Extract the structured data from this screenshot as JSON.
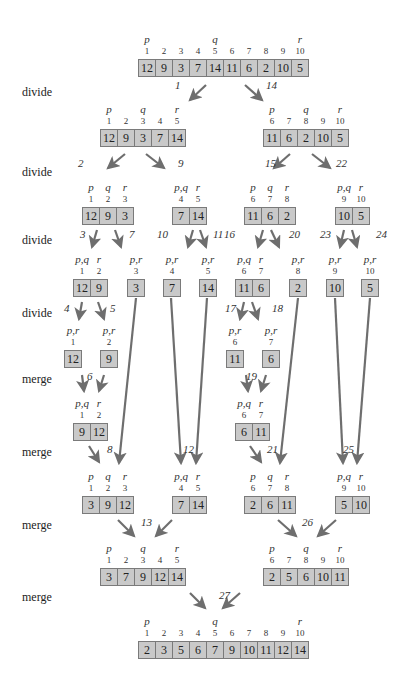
{
  "diagram": {
    "colors": {
      "cell_fill": "#c9c9c9",
      "cell_border": "#7a7a7a",
      "arrow": "#6e6e6e",
      "text": "#222222"
    },
    "row_labels": [
      {
        "text": "divide",
        "y": 93
      },
      {
        "text": "divide",
        "y": 173
      },
      {
        "text": "divide",
        "y": 241
      },
      {
        "text": "divide",
        "y": 314
      },
      {
        "text": "merge",
        "y": 380
      },
      {
        "text": "merge",
        "y": 453
      },
      {
        "text": "merge",
        "y": 526
      },
      {
        "text": "merge",
        "y": 598
      }
    ],
    "arrays": [
      {
        "id": "a0",
        "x": 138,
        "y": 59,
        "start": 1,
        "values": [
          12,
          9,
          3,
          7,
          14,
          11,
          6,
          2,
          10,
          5
        ],
        "pointers": {
          "p": 0,
          "q": 4,
          "r": 9
        }
      },
      {
        "id": "a1",
        "x": 100,
        "y": 129,
        "start": 1,
        "values": [
          12,
          9,
          3,
          7,
          14
        ],
        "pointers": {
          "p": 0,
          "q": 2,
          "r": 4
        }
      },
      {
        "id": "a2",
        "x": 263,
        "y": 129,
        "start": 6,
        "values": [
          11,
          6,
          2,
          10,
          5
        ],
        "pointers": {
          "p": 0,
          "q": 2,
          "r": 4
        }
      },
      {
        "id": "a3",
        "x": 82,
        "y": 207,
        "start": 1,
        "values": [
          12,
          9,
          3
        ],
        "pointers": {
          "p": 0,
          "q": 1,
          "r": 2
        }
      },
      {
        "id": "a4",
        "x": 172,
        "y": 207,
        "start": 4,
        "values": [
          7,
          14
        ],
        "pointers": {
          "p,q": 0,
          "r": 1
        }
      },
      {
        "id": "a5",
        "x": 244,
        "y": 207,
        "start": 6,
        "values": [
          11,
          6,
          2
        ],
        "pointers": {
          "p": 0,
          "q": 1,
          "r": 2
        }
      },
      {
        "id": "a6",
        "x": 335,
        "y": 207,
        "start": 9,
        "values": [
          10,
          5
        ],
        "pointers": {
          "p,q": 0,
          "r": 1
        }
      },
      {
        "id": "a7",
        "x": 73,
        "y": 279,
        "start": 1,
        "values": [
          12,
          9
        ],
        "pointers": {
          "p,q": 0,
          "r": 1
        }
      },
      {
        "id": "a8",
        "x": 127,
        "y": 279,
        "start": 3,
        "values": [
          3
        ],
        "pointers": {
          "p,r": 0
        }
      },
      {
        "id": "a9",
        "x": 163,
        "y": 279,
        "start": 4,
        "values": [
          7
        ],
        "pointers": {
          "p,r": 0
        }
      },
      {
        "id": "a10",
        "x": 199,
        "y": 279,
        "start": 5,
        "values": [
          14
        ],
        "pointers": {
          "p,r": 0
        }
      },
      {
        "id": "a11",
        "x": 235,
        "y": 279,
        "start": 6,
        "values": [
          11,
          6
        ],
        "pointers": {
          "p,q": 0,
          "r": 1
        }
      },
      {
        "id": "a12",
        "x": 289,
        "y": 279,
        "start": 8,
        "values": [
          2
        ],
        "pointers": {
          "p,r": 0
        }
      },
      {
        "id": "a13",
        "x": 326,
        "y": 279,
        "start": 9,
        "values": [
          10
        ],
        "pointers": {
          "p,r": 0
        }
      },
      {
        "id": "a14",
        "x": 361,
        "y": 279,
        "start": 10,
        "values": [
          5
        ],
        "pointers": {
          "p,r": 0
        }
      },
      {
        "id": "a15",
        "x": 64,
        "y": 350,
        "start": 1,
        "values": [
          12
        ],
        "pointers": {
          "p,r": 0
        }
      },
      {
        "id": "a16",
        "x": 100,
        "y": 350,
        "start": 2,
        "values": [
          9
        ],
        "pointers": {
          "p,r": 0
        }
      },
      {
        "id": "a17",
        "x": 226,
        "y": 350,
        "start": 6,
        "values": [
          11
        ],
        "pointers": {
          "p,r": 0
        }
      },
      {
        "id": "a18",
        "x": 262,
        "y": 350,
        "start": 7,
        "values": [
          6
        ],
        "pointers": {
          "p,r": 0
        }
      },
      {
        "id": "a19",
        "x": 73,
        "y": 423,
        "start": 1,
        "values": [
          9,
          12
        ],
        "pointers": {
          "p,q": 0,
          "r": 1
        }
      },
      {
        "id": "a20",
        "x": 235,
        "y": 423,
        "start": 6,
        "values": [
          6,
          11
        ],
        "pointers": {
          "p,q": 0,
          "r": 1
        }
      },
      {
        "id": "a21",
        "x": 82,
        "y": 496,
        "start": 1,
        "values": [
          3,
          9,
          12
        ],
        "pointers": {
          "p": 0,
          "q": 1,
          "r": 2
        }
      },
      {
        "id": "a22",
        "x": 172,
        "y": 496,
        "start": 4,
        "values": [
          7,
          14
        ],
        "pointers": {
          "p,q": 0,
          "r": 1
        }
      },
      {
        "id": "a23",
        "x": 244,
        "y": 496,
        "start": 6,
        "values": [
          2,
          6,
          11
        ],
        "pointers": {
          "p": 0,
          "q": 1,
          "r": 2
        }
      },
      {
        "id": "a24",
        "x": 335,
        "y": 496,
        "start": 9,
        "values": [
          5,
          10
        ],
        "pointers": {
          "p,q": 0,
          "r": 1
        }
      },
      {
        "id": "a25",
        "x": 100,
        "y": 568,
        "start": 1,
        "values": [
          3,
          7,
          9,
          12,
          14
        ],
        "pointers": {
          "p": 0,
          "q": 2,
          "r": 4
        }
      },
      {
        "id": "a26",
        "x": 263,
        "y": 568,
        "start": 6,
        "values": [
          2,
          5,
          6,
          10,
          11
        ],
        "pointers": {
          "p": 0,
          "q": 2,
          "r": 4
        }
      },
      {
        "id": "a27",
        "x": 138,
        "y": 641,
        "start": 1,
        "values": [
          2,
          3,
          5,
          6,
          7,
          9,
          10,
          11,
          12,
          14
        ],
        "pointers": {
          "p": 0,
          "q": 4,
          "r": 9
        }
      }
    ],
    "steps": [
      {
        "n": "1",
        "x": 175,
        "y": 87
      },
      {
        "n": "14",
        "x": 266,
        "y": 87
      },
      {
        "n": "2",
        "x": 78,
        "y": 165
      },
      {
        "n": "9",
        "x": 178,
        "y": 165
      },
      {
        "n": "15",
        "x": 265,
        "y": 165
      },
      {
        "n": "22",
        "x": 336,
        "y": 165
      },
      {
        "n": "3",
        "x": 80,
        "y": 236
      },
      {
        "n": "7",
        "x": 129,
        "y": 236
      },
      {
        "n": "10",
        "x": 157,
        "y": 236
      },
      {
        "n": "11",
        "x": 213,
        "y": 236
      },
      {
        "n": "16",
        "x": 224,
        "y": 236
      },
      {
        "n": "20",
        "x": 289,
        "y": 236
      },
      {
        "n": "23",
        "x": 320,
        "y": 236
      },
      {
        "n": "24",
        "x": 376,
        "y": 236
      },
      {
        "n": "4",
        "x": 64,
        "y": 310
      },
      {
        "n": "5",
        "x": 110,
        "y": 310
      },
      {
        "n": "17",
        "x": 225,
        "y": 310
      },
      {
        "n": "18",
        "x": 272,
        "y": 310
      },
      {
        "n": "6",
        "x": 87,
        "y": 378
      },
      {
        "n": "19",
        "x": 246,
        "y": 378
      },
      {
        "n": "8",
        "x": 107,
        "y": 451
      },
      {
        "n": "12",
        "x": 183,
        "y": 451
      },
      {
        "n": "21",
        "x": 267,
        "y": 451
      },
      {
        "n": "25",
        "x": 343,
        "y": 451
      },
      {
        "n": "13",
        "x": 141,
        "y": 524
      },
      {
        "n": "26",
        "x": 302,
        "y": 524
      },
      {
        "n": "27",
        "x": 219,
        "y": 597
      }
    ],
    "arrows": [
      [
        206,
        85,
        190,
        100
      ],
      [
        245,
        85,
        262,
        100
      ],
      [
        125,
        154,
        108,
        168
      ],
      [
        146,
        154,
        164,
        168
      ],
      [
        290,
        154,
        274,
        168
      ],
      [
        312,
        154,
        330,
        168
      ],
      [
        97,
        230,
        92,
        247
      ],
      [
        115,
        230,
        121,
        247
      ],
      [
        193,
        230,
        188,
        247
      ],
      [
        200,
        230,
        206,
        247
      ],
      [
        263,
        230,
        258,
        247
      ],
      [
        271,
        230,
        279,
        247
      ],
      [
        344,
        230,
        340,
        247
      ],
      [
        352,
        230,
        357,
        247
      ],
      [
        82,
        302,
        79,
        319
      ],
      [
        98,
        302,
        104,
        319
      ],
      [
        244,
        302,
        240,
        319
      ],
      [
        252,
        302,
        258,
        319
      ],
      [
        82,
        375,
        84,
        391
      ],
      [
        104,
        375,
        99,
        391
      ],
      [
        246,
        375,
        248,
        391
      ],
      [
        266,
        375,
        261,
        391
      ],
      [
        136,
        298,
        119,
        463
      ],
      [
        171,
        298,
        181,
        463
      ],
      [
        207,
        298,
        196,
        463
      ],
      [
        298,
        298,
        280,
        463
      ],
      [
        335,
        298,
        343,
        463
      ],
      [
        370,
        298,
        357,
        463
      ],
      [
        89,
        446,
        99,
        462
      ],
      [
        250,
        446,
        261,
        462
      ],
      [
        118,
        520,
        134,
        536
      ],
      [
        172,
        520,
        156,
        536
      ],
      [
        278,
        520,
        296,
        536
      ],
      [
        336,
        520,
        318,
        536
      ],
      [
        190,
        593,
        205,
        608
      ],
      [
        240,
        593,
        223,
        608
      ]
    ]
  }
}
